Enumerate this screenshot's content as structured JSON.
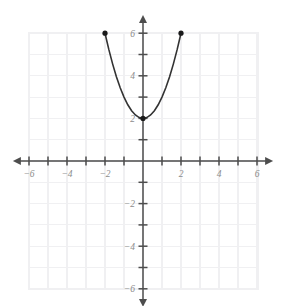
{
  "chart_data": {
    "type": "line",
    "title": "",
    "subtitle": "",
    "xlabel": "",
    "ylabel": "",
    "xlim": [
      -6.2,
      6.2
    ],
    "ylim": [
      -6.2,
      6.2
    ],
    "grid": true,
    "legend": null,
    "x_ticks": [
      -6,
      -5,
      -4,
      -3,
      -2,
      -1,
      1,
      2,
      3,
      4,
      5,
      6
    ],
    "y_ticks": [
      -6,
      -5,
      -4,
      -3,
      -2,
      -1,
      1,
      2,
      3,
      4,
      5,
      6
    ],
    "x_tick_labels": [
      {
        "value": -6,
        "label": "−6"
      },
      {
        "value": -4,
        "label": "−4"
      },
      {
        "value": -2,
        "label": "−2"
      },
      {
        "value": 2,
        "label": "2"
      },
      {
        "value": 4,
        "label": "4"
      },
      {
        "value": 6,
        "label": "6"
      }
    ],
    "y_tick_labels": [
      {
        "value": 6,
        "label": "6"
      },
      {
        "value": 4,
        "label": "4"
      },
      {
        "value": 2,
        "label": "2"
      },
      {
        "value": -2,
        "label": "−2"
      },
      {
        "value": -4,
        "label": "−4"
      },
      {
        "value": -6,
        "label": "−6"
      }
    ],
    "series": [
      {
        "name": "parabola",
        "equation": "y = x^2 + 2",
        "domain": [
          -2,
          2
        ],
        "vertex": [
          0,
          2
        ],
        "color": "#333333",
        "points": [
          [
            -2.0,
            6.0
          ],
          [
            -1.8,
            5.24
          ],
          [
            -1.6,
            4.56
          ],
          [
            -1.4,
            3.96
          ],
          [
            -1.2,
            3.44
          ],
          [
            -1.0,
            3.0
          ],
          [
            -0.8,
            2.64
          ],
          [
            -0.6,
            2.36
          ],
          [
            -0.4,
            2.16
          ],
          [
            -0.2,
            2.04
          ],
          [
            0.0,
            2.0
          ],
          [
            0.2,
            2.04
          ],
          [
            0.4,
            2.16
          ],
          [
            0.6,
            2.36
          ],
          [
            0.8,
            2.64
          ],
          [
            1.0,
            3.0
          ],
          [
            1.2,
            3.44
          ],
          [
            1.4,
            3.96
          ],
          [
            1.6,
            4.56
          ],
          [
            1.8,
            5.24
          ],
          [
            2.0,
            6.0
          ]
        ],
        "marked_points": [
          {
            "x": -2,
            "y": 6,
            "style": "filled"
          },
          {
            "x": 0,
            "y": 2,
            "style": "filled"
          },
          {
            "x": 2,
            "y": 6,
            "style": "filled"
          }
        ]
      }
    ],
    "colors": {
      "grid": "#f0f0f2",
      "axis": "#4d4d4d",
      "curve": "#333333",
      "tick_label": "#8c8c8c",
      "background": "#ffffff"
    }
  }
}
